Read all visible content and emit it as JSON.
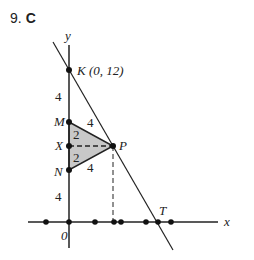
{
  "question": {
    "number": "9.",
    "answer": "C"
  },
  "axes": {
    "x_label": "x",
    "y_label": "y",
    "origin_label": "0"
  },
  "points": {
    "K": {
      "label": "K (0, 12)"
    },
    "M": {
      "label": "M"
    },
    "X": {
      "label": "X"
    },
    "N": {
      "label": "N"
    },
    "P": {
      "label": "P"
    },
    "T": {
      "label": "T"
    }
  },
  "segment_labels": {
    "KM": "4",
    "MX": "2",
    "XN": "2",
    "NO": "4",
    "MP": "4",
    "NP": "4"
  },
  "colors": {
    "triangle_fill": "#c8c8c8",
    "stroke": "#222222"
  }
}
